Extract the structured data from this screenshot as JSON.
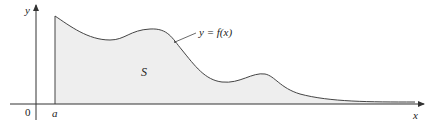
{
  "diagram": {
    "axes": {
      "x_label": "x",
      "y_label": "y",
      "origin_label": "0"
    },
    "point_a_label": "a",
    "region_label": "S",
    "curve_label": "y = f(x)",
    "colors": {
      "fill": "#eeeeee",
      "stroke": "#444444",
      "axis": "#333333"
    }
  }
}
